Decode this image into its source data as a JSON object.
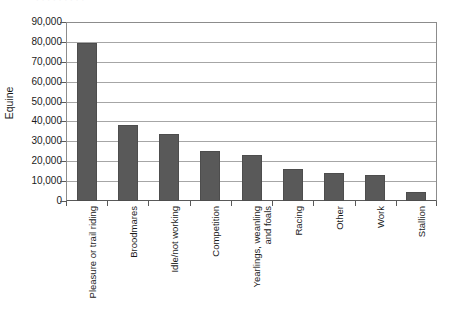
{
  "chart_data": {
    "type": "bar",
    "title": "",
    "xlabel": "",
    "ylabel": "Equine",
    "ylim": [
      0,
      90000
    ],
    "ytick_step": 10000,
    "grid": true,
    "legend": false,
    "orientation": "vertical",
    "bar_color": "#595959",
    "categories": [
      "Pleasure or trail riding",
      "Broodmares",
      "Idle/not working",
      "Competition",
      "Yearlings, weanling\nand foals",
      "Racing",
      "Other",
      "Work",
      "Stallion"
    ],
    "values": [
      79500,
      38000,
      33500,
      25000,
      23000,
      16000,
      14000,
      13000,
      4500
    ],
    "ytick_labels": [
      "90,000",
      "80,000",
      "70,000",
      "60,000",
      "50,000",
      "40,000",
      "30,000",
      "20,000",
      "10,000",
      "0"
    ],
    "ytick_values": [
      90000,
      80000,
      70000,
      60000,
      50000,
      40000,
      30000,
      20000,
      10000,
      0
    ]
  },
  "artifacts": {
    "title_remnant": "· ·  ·   ·    ·  ·   ·    ·  ·"
  }
}
